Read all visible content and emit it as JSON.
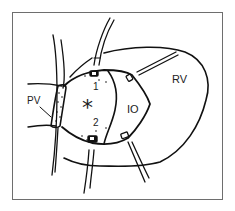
{
  "figure": {
    "labels": {
      "pulmonary_valve": "PV",
      "right_ventricle": "RV",
      "infundibular_outlet": "IO",
      "suture_1": "1",
      "suture_2": "2",
      "defect_marker": "*"
    },
    "colors": {
      "stroke": "#111111",
      "frame": "#6e6e6e",
      "background": "#ffffff"
    }
  }
}
